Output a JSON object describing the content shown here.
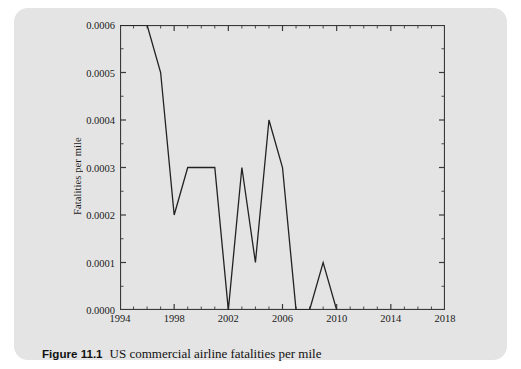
{
  "figure": {
    "caption_label": "Figure 11.1",
    "caption_text": "US commercial airline fatalities per mile"
  },
  "colors": {
    "card_background": "#e4e4e4",
    "page_background": "#ffffff",
    "axis": "#3a3a3a",
    "line": "#222222",
    "text": "#1a1a1a"
  },
  "chart_data": {
    "type": "line",
    "title": "",
    "xlabel": "",
    "ylabel": "Fatalities per mile",
    "xlim": [
      1994,
      2018
    ],
    "ylim": [
      0.0,
      0.0006
    ],
    "grid": false,
    "legend": false,
    "x_major_ticks": [
      1994,
      1998,
      2002,
      2006,
      2010,
      2014,
      2018
    ],
    "x_tick_labels": [
      "1994",
      "1998",
      "2002",
      "2006",
      "2010",
      "2014",
      "2018"
    ],
    "x_minor_tick_interval": 1,
    "y_major_ticks": [
      0.0,
      0.0001,
      0.0002,
      0.0003,
      0.0004,
      0.0005,
      0.0006
    ],
    "y_tick_labels": [
      "0.0000",
      "0.0001",
      "0.0002",
      "0.0003",
      "0.0004",
      "0.0005",
      "0.0006"
    ],
    "y_minor_tick_interval": 5e-05,
    "series": [
      {
        "name": "US commercial airline fatalities per mile",
        "x": [
          1994,
          1996,
          1997,
          1998,
          1999,
          2000,
          2001,
          2002,
          2003,
          2004,
          2005,
          2006,
          2007,
          2008,
          2009,
          2010
        ],
        "values": [
          0.0006,
          0.0006,
          0.0005,
          0.0002,
          0.0003,
          0.0003,
          0.0003,
          0.0,
          0.0003,
          0.0001,
          0.0004,
          0.0003,
          0.0,
          0.0,
          0.0001,
          0.0
        ]
      }
    ]
  }
}
